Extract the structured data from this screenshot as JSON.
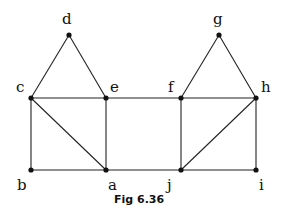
{
  "caption": "Fig 6.36",
  "nodes": [
    {
      "id": "d",
      "x": 69,
      "y": 35,
      "lx": 62,
      "ly": 24
    },
    {
      "id": "c",
      "x": 31,
      "y": 98,
      "lx": 16,
      "ly": 92
    },
    {
      "id": "e",
      "x": 106,
      "y": 98,
      "lx": 110,
      "ly": 92
    },
    {
      "id": "g",
      "x": 219,
      "y": 35,
      "lx": 213,
      "ly": 24
    },
    {
      "id": "f",
      "x": 181,
      "y": 98,
      "lx": 168,
      "ly": 92
    },
    {
      "id": "h",
      "x": 256,
      "y": 98,
      "lx": 261,
      "ly": 92
    },
    {
      "id": "b",
      "x": 31,
      "y": 170,
      "lx": 17,
      "ly": 190
    },
    {
      "id": "a",
      "x": 106,
      "y": 170,
      "lx": 108,
      "ly": 190
    },
    {
      "id": "j",
      "x": 181,
      "y": 170,
      "lx": 167,
      "ly": 190
    },
    {
      "id": "i",
      "x": 256,
      "y": 170,
      "lx": 259,
      "ly": 190
    }
  ],
  "edges": [
    [
      "c",
      "d"
    ],
    [
      "d",
      "e"
    ],
    [
      "c",
      "e"
    ],
    [
      "e",
      "f"
    ],
    [
      "f",
      "h"
    ],
    [
      "f",
      "g"
    ],
    [
      "g",
      "h"
    ],
    [
      "c",
      "b"
    ],
    [
      "c",
      "a"
    ],
    [
      "e",
      "a"
    ],
    [
      "b",
      "a"
    ],
    [
      "a",
      "j"
    ],
    [
      "f",
      "j"
    ],
    [
      "h",
      "j"
    ],
    [
      "j",
      "i"
    ],
    [
      "h",
      "i"
    ]
  ]
}
